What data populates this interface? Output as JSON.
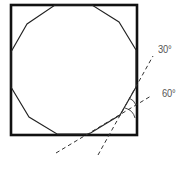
{
  "diagram": {
    "square": {
      "x": 11,
      "y": 5,
      "width": 126,
      "height": 130,
      "stroke": "#111111",
      "stroke_width": 2.6
    },
    "polygon": {
      "sides": 12,
      "stroke": "#222222",
      "stroke_width": 1.1,
      "points": "55,5 92,5 119,22 136,50 136,87 120,115 89,134 57,134 29,117 11,87 11,52 27,24"
    },
    "construction_lines": [
      {
        "name": "line-30-degree",
        "x1": 98,
        "y1": 155,
        "x2": 153,
        "y2": 56,
        "dash": "4,3",
        "stroke": "#333333"
      },
      {
        "name": "line-60-degree",
        "x1": 56,
        "y1": 153,
        "x2": 151,
        "y2": 96,
        "dash": "4,3",
        "stroke": "#333333"
      }
    ],
    "angle_arcs": [
      {
        "name": "arc-upper",
        "d": "M 130 98 Q 135 101 136 106"
      },
      {
        "name": "arc-lower",
        "d": "M 126 108 Q 133 111 135 118"
      }
    ],
    "labels": {
      "angle_30": "30°",
      "angle_60": "60°"
    }
  }
}
